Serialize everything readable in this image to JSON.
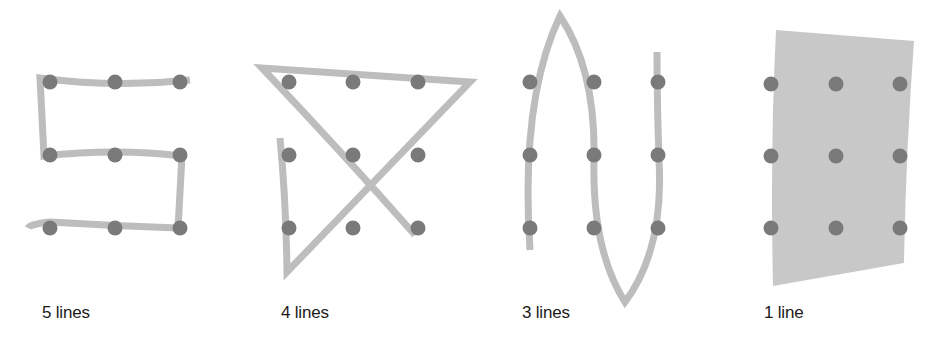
{
  "figure": {
    "panels": [
      {
        "id": "five-lines",
        "label": "5 lines"
      },
      {
        "id": "four-lines",
        "label": "4 lines"
      },
      {
        "id": "three-lines",
        "label": "3 lines"
      },
      {
        "id": "one-line",
        "label": "1 line"
      }
    ],
    "grid": {
      "rows": 3,
      "cols": 3
    },
    "colors": {
      "dot": "#7a7a7a",
      "stroke": "#bdbdbd",
      "background": "#ffffff",
      "text": "#1a1a1a"
    }
  }
}
